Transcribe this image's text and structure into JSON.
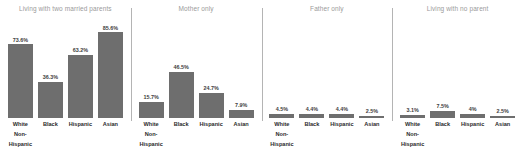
{
  "chart_data": {
    "type": "bar",
    "title": "",
    "subtitle": "",
    "xlabel": "",
    "ylabel": "",
    "ylim": [
      0,
      100
    ],
    "grid": false,
    "legend": "none",
    "value_suffix": "%",
    "categories": [
      "White Non-Hispanic",
      "Black",
      "Hispanic",
      "Asian"
    ],
    "panels": [
      {
        "title": "Living with two married parents",
        "categories": [
          "White Non-Hispanic",
          "Black",
          "Hispanic",
          "Asian"
        ],
        "values": [
          73.6,
          36.3,
          63.2,
          85.6
        ],
        "value_labels": [
          "73.6%",
          "36.3%",
          "63.2%",
          "85.6%"
        ]
      },
      {
        "title": "Mother only",
        "categories": [
          "White Non-Hispanic",
          "Black",
          "Hispanic",
          "Asian"
        ],
        "values": [
          15.7,
          46.5,
          24.7,
          7.9
        ],
        "value_labels": [
          "15.7%",
          "46.5%",
          "24.7%",
          "7.9%"
        ]
      },
      {
        "title": "Father only",
        "categories": [
          "White Non-Hispanic",
          "Black",
          "Hispanic",
          "Asian"
        ],
        "values": [
          4.5,
          4.4,
          4.4,
          2.5
        ],
        "value_labels": [
          "4.5%",
          "4.4%",
          "4.4%",
          "2.5%"
        ]
      },
      {
        "title": "Living with no parent",
        "categories": [
          "White Non-Hispanic",
          "Black",
          "Hispanic",
          "Asian"
        ],
        "values": [
          3.1,
          7.5,
          4.0,
          2.5
        ],
        "value_labels": [
          "3.1%",
          "7.5%",
          "4%",
          "2.5%"
        ]
      }
    ]
  },
  "style": {
    "bar_color": "#6e6e6e",
    "title_color": "#9a9a9a",
    "value_label_color": "#3d3d3d",
    "category_label_color": "#2b2b2b",
    "divider_color": "#b4b4b4",
    "background": "#ffffff"
  }
}
